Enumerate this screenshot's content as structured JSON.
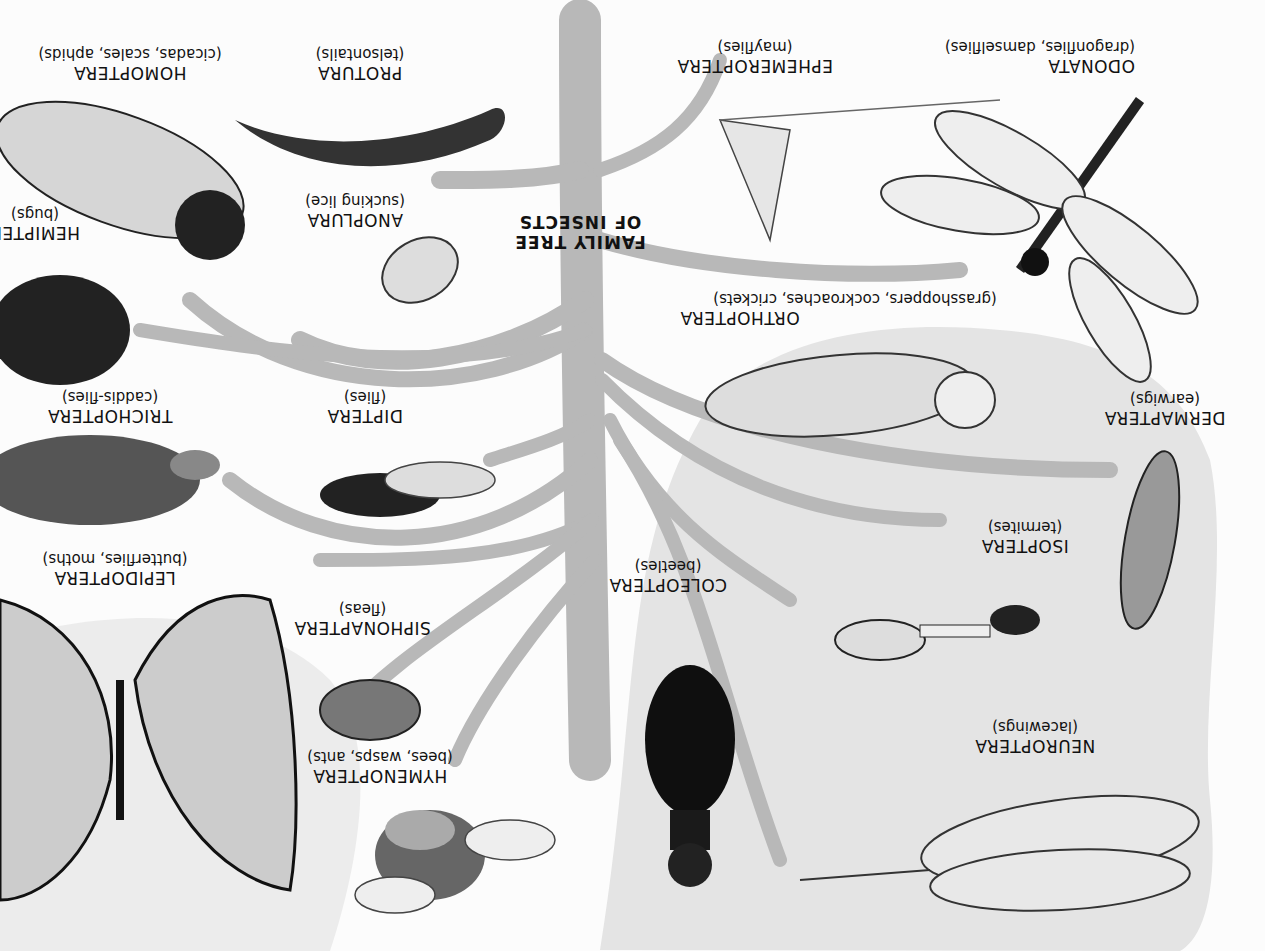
{
  "title": {
    "line1": "FAMILY TREE",
    "line2": "OF INSECTS"
  },
  "orientation": "rotated-180",
  "colors": {
    "background": "#fcfcfc",
    "branch": "#b9b9b9",
    "shade": "#e2e2e2",
    "ink": "#111111"
  },
  "orders": [
    {
      "id": "homoptera",
      "name": "HOMOPTERA",
      "common": "(cicadas, scales, aphids)"
    },
    {
      "id": "protura",
      "name": "PROTURA",
      "common": "(telsontails)"
    },
    {
      "id": "ephemeroptera",
      "name": "EPHEMEROPTERA",
      "common": "(mayflies)"
    },
    {
      "id": "odonata",
      "name": "ODONATA",
      "common": "(dragonflies, damselflies)"
    },
    {
      "id": "hemiptera",
      "name": "HEMIPTERA",
      "common": "(bugs)"
    },
    {
      "id": "anoplura",
      "name": "ANOPLURA",
      "common": "(sucking lice)"
    },
    {
      "id": "orthoptera",
      "name": "ORTHOPTERA",
      "common": "(grasshoppers, cockroaches, crickets)"
    },
    {
      "id": "trichoptera",
      "name": "TRICHOPTERA",
      "common": "(caddis-flies)"
    },
    {
      "id": "diptera",
      "name": "DIPTERA",
      "common": "(flies)"
    },
    {
      "id": "dermaptera",
      "name": "DERMAPTERA",
      "common": "(earwigs)"
    },
    {
      "id": "lepidoptera",
      "name": "LEPIDOPTERA",
      "common": "(butterflies, moths)"
    },
    {
      "id": "isoptera",
      "name": "ISOPTERA",
      "common": "(termites)"
    },
    {
      "id": "coleoptera",
      "name": "COLEOPTERA",
      "common": "(beetles)"
    },
    {
      "id": "siphonaptera",
      "name": "SIPHONAPTERA",
      "common": "(fleas)"
    },
    {
      "id": "neuroptera",
      "name": "NEUROPTERA",
      "common": "(lacewings)"
    },
    {
      "id": "hymenoptera",
      "name": "HYMENOPTERA",
      "common": "(bees, wasps, ants)"
    }
  ]
}
